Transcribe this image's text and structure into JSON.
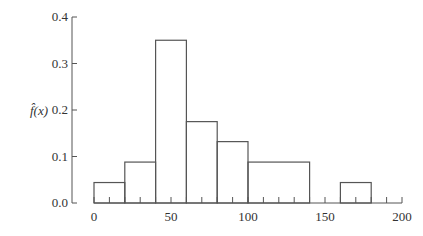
{
  "chart_data": {
    "type": "bar",
    "subtype": "histogram-step",
    "title": "",
    "xlabel": "",
    "ylabel": "f̂(x)",
    "bins": [
      {
        "x0": 0,
        "x1": 20,
        "y": 0.044
      },
      {
        "x0": 20,
        "x1": 40,
        "y": 0.088
      },
      {
        "x0": 40,
        "x1": 60,
        "y": 0.35
      },
      {
        "x0": 60,
        "x1": 80,
        "y": 0.175
      },
      {
        "x0": 80,
        "x1": 100,
        "y": 0.132
      },
      {
        "x0": 100,
        "x1": 140,
        "y": 0.088
      },
      {
        "x0": 140,
        "x1": 160,
        "y": 0.0
      },
      {
        "x0": 160,
        "x1": 180,
        "y": 0.044
      }
    ],
    "categories": [
      "0-20",
      "20-40",
      "40-60",
      "60-80",
      "80-100",
      "100-140",
      "140-160",
      "160-180"
    ],
    "values": [
      0.044,
      0.088,
      0.35,
      0.175,
      0.132,
      0.088,
      0.0,
      0.044
    ],
    "xlim": [
      0,
      200
    ],
    "ylim": [
      0,
      0.4
    ],
    "x_ticks": [
      0,
      50,
      100,
      150,
      200
    ],
    "x_tick_labels": [
      "0",
      "50",
      "100",
      "150",
      "200"
    ],
    "x_minor_tick_step": 10,
    "y_ticks": [
      0.0,
      0.1,
      0.2,
      0.3,
      0.4
    ],
    "y_tick_labels": [
      "0.0",
      "0.1",
      "0.2",
      "0.3",
      "0.4"
    ],
    "grid": false,
    "legend": null
  },
  "colors": {
    "line": "#555555",
    "text": "#333333"
  }
}
